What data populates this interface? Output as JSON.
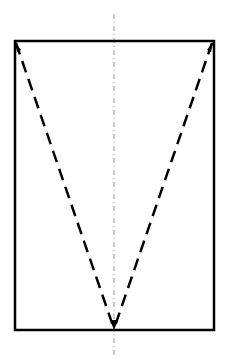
{
  "diagram": {
    "colors": {
      "outline": "#000000",
      "dashed": "#000000",
      "centerline": "#999999",
      "background": "#ffffff"
    },
    "elements": {
      "rectangle": "solid outline",
      "diagonals": "dashed lines from top corners to bottom center with arrowheads",
      "centerline": "dash-dot symmetry axis"
    }
  }
}
